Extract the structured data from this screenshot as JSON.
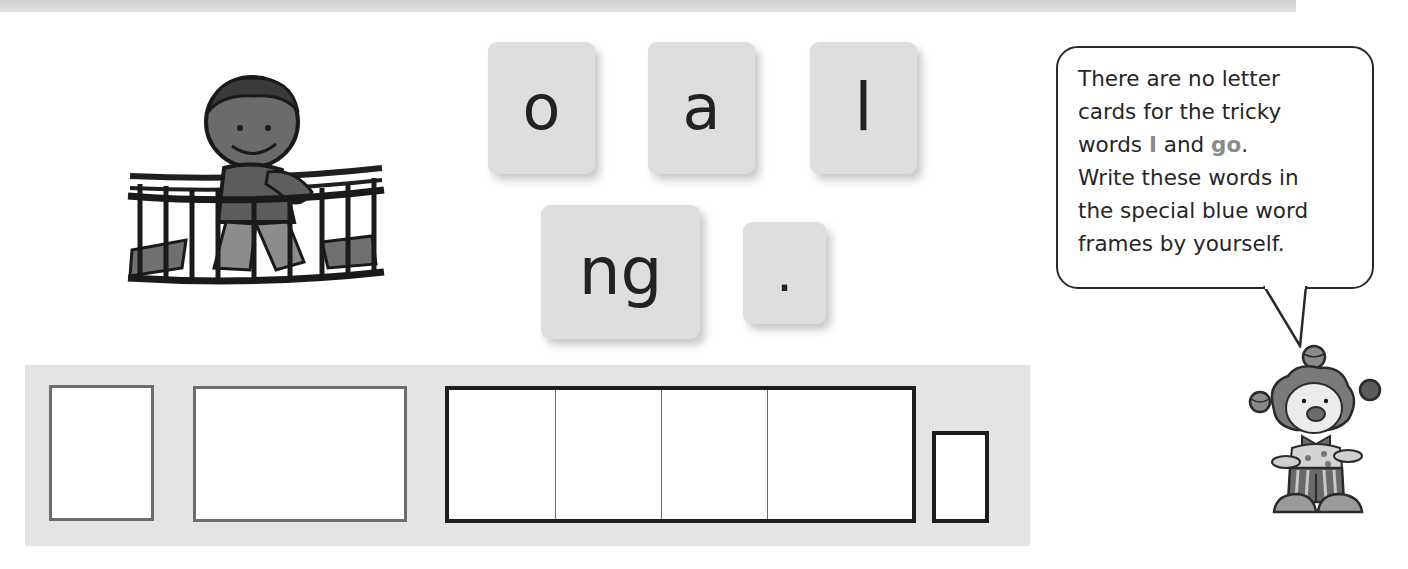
{
  "page": {
    "background": "#ffffff",
    "top_band_color": "#d6d6d6"
  },
  "illustrations": {
    "boy_on_bridge": {
      "icon": "boy-crossing-rope-bridge-icon",
      "caption": ""
    },
    "clown": {
      "icon": "juggling-clown-icon",
      "caption": ""
    }
  },
  "letter_cards": [
    {
      "label": "o"
    },
    {
      "label": "a"
    },
    {
      "label": "l"
    },
    {
      "label": "ng"
    },
    {
      "label": "."
    }
  ],
  "speech_bubble": {
    "line1": "There are no letter",
    "line2": "cards for the tricky",
    "line3_before": "words ",
    "tricky_word_1": "I",
    "line3_mid": " and ",
    "tricky_word_2": "go",
    "line3_after": ".",
    "line4": "Write these words in",
    "line5": "the special blue word",
    "line6": "frames by yourself.",
    "highlight_color": "#8a8a8a"
  },
  "word_frames": {
    "strip_color": "#e4e4e4",
    "frames": [
      {
        "type": "tricky",
        "border_color": "#6d6d6d",
        "cells": 1
      },
      {
        "type": "tricky",
        "border_color": "#6d6d6d",
        "cells": 1
      },
      {
        "type": "decodable",
        "border_color": "#1d1d1d",
        "cells": 4
      },
      {
        "type": "punctuation",
        "border_color": "#1d1d1d",
        "cells": 1
      }
    ]
  }
}
